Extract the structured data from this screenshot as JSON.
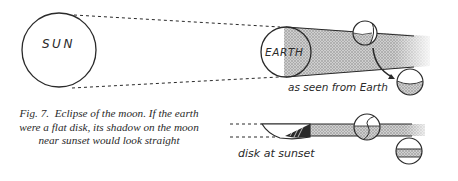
{
  "figure": {
    "labels": {
      "sun": "SUN",
      "earth": "EARTH",
      "as_seen_from_earth": "as seen from Earth",
      "disk_at_sunset": "disk at sunset"
    },
    "caption": {
      "number": "Fig. 7.",
      "text": "Eclipse of the moon. If the earth were a flat disk, its shadow on the moon near sunset would look straight"
    },
    "colors": {
      "ink": "#2a2a2a",
      "shadow": "#b4b4b4",
      "background": "#ffffff"
    }
  }
}
